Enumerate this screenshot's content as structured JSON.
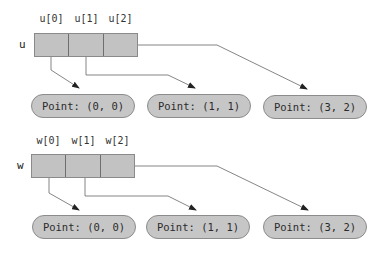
{
  "diagram": {
    "colors": {
      "cell_fill": "#c2c2c2",
      "cell_border": "#6e6e6e",
      "pill_fill": "#c6c6c6",
      "pill_border": "#8c8c8c",
      "arrow": "#555555"
    },
    "arrays": [
      {
        "name": "u",
        "indices": [
          "u[0]",
          "u[1]",
          "u[2]"
        ],
        "targets": [
          {
            "label": "Point: (0, 0)"
          },
          {
            "label": "Point: (1, 1)"
          },
          {
            "label": "Point: (3, 2)"
          }
        ]
      },
      {
        "name": "w",
        "indices": [
          "w[0]",
          "w[1]",
          "w[2]"
        ],
        "targets": [
          {
            "label": "Point: (0, 0)"
          },
          {
            "label": "Point: (1, 1)"
          },
          {
            "label": "Point: (3, 2)"
          }
        ]
      }
    ]
  }
}
